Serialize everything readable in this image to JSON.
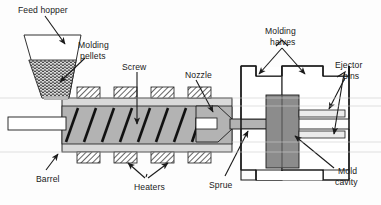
{
  "figure": {
    "background_color": "#fdfdfd",
    "line_color": "#1a1a1a",
    "labels": [
      {
        "key": "feed_hopper",
        "text": "Feed hopper",
        "x": 18,
        "y": 5,
        "name": "label-feed-hopper"
      },
      {
        "key": "molding_pellets_l1",
        "text": "Molding",
        "x": 78,
        "y": 40,
        "name": "label-molding-pellets-line1"
      },
      {
        "key": "molding_pellets_l2",
        "text": "pellets",
        "x": 78,
        "y": 51,
        "name": "label-molding-pellets-line2"
      },
      {
        "key": "screw",
        "text": "Screw",
        "x": 122,
        "y": 62,
        "name": "label-screw"
      },
      {
        "key": "nozzle",
        "text": "Nozzle",
        "x": 185,
        "y": 70,
        "name": "label-nozzle"
      },
      {
        "key": "molding_halves_l1",
        "text": "Molding",
        "x": 265,
        "y": 26,
        "name": "label-molding-halves-line1"
      },
      {
        "key": "molding_halves_l2",
        "text": "halves",
        "x": 270,
        "y": 37,
        "name": "label-molding-halves-line2"
      },
      {
        "key": "ejector_pins_l1",
        "text": "Ejector",
        "x": 335,
        "y": 60,
        "name": "label-ejector-pins-line1"
      },
      {
        "key": "ejector_pins_l2",
        "text": "pins",
        "x": 343,
        "y": 71,
        "name": "label-ejector-pins-line2"
      },
      {
        "key": "barrel",
        "text": "Barrel",
        "x": 36,
        "y": 174,
        "name": "label-barrel"
      },
      {
        "key": "heaters",
        "text": "Heaters",
        "x": 134,
        "y": 182,
        "name": "label-heaters"
      },
      {
        "key": "sprue",
        "text": "Sprue",
        "x": 209,
        "y": 180,
        "name": "label-sprue"
      },
      {
        "key": "mold_cavity_l1",
        "text": "Mold",
        "x": 338,
        "y": 166,
        "name": "label-mold-cavity-line1"
      },
      {
        "key": "mold_cavity_l2",
        "text": "cavity",
        "x": 335,
        "y": 177,
        "name": "label-mold-cavity-line2"
      }
    ],
    "parts": [
      {
        "name": "feed-hopper",
        "label": "Feed hopper",
        "fill": "#ffffff"
      },
      {
        "name": "molding-pellets",
        "label": "Molding pellets",
        "fill": "stipple-pattern"
      },
      {
        "name": "screw",
        "label": "Screw",
        "fill": "#b3b3b3"
      },
      {
        "name": "barrel",
        "label": "Barrel",
        "fill": "#d9d9d9"
      },
      {
        "name": "heater-blocks",
        "label": "Heaters",
        "fill": "hatch-pattern",
        "count_top": 4,
        "count_bottom": 4
      },
      {
        "name": "nozzle",
        "label": "Nozzle",
        "fill": "#b3b3b3"
      },
      {
        "name": "sprue",
        "label": "Sprue",
        "fill": "#b3b3b3"
      },
      {
        "name": "mold-halves",
        "label": "Molding halves",
        "fill": "#ffffff"
      },
      {
        "name": "mold-cavity",
        "label": "Mold cavity",
        "fill": "#8c8c8c"
      },
      {
        "name": "ejector-pins",
        "label": "Ejector pins",
        "fill": "#e8e8e8",
        "count": 2
      }
    ]
  }
}
